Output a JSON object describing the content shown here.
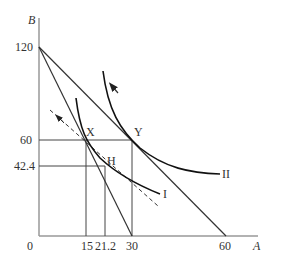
{
  "diagram": {
    "type": "indifference-curve-budget-diagram",
    "axes": {
      "x_label": "A",
      "y_label": "B",
      "origin_label": "0",
      "x_ticks": [
        "15",
        "21.2",
        "30",
        "60"
      ],
      "y_ticks": [
        "120",
        "60",
        "42.4"
      ]
    },
    "points": {
      "x": "X",
      "y": "Y",
      "h": "H"
    },
    "curves": {
      "ic1": "I",
      "ic2": "II"
    },
    "colors": {
      "axis": "#999999",
      "line": "#333333",
      "curve": "#111111",
      "text": "#333333"
    }
  }
}
